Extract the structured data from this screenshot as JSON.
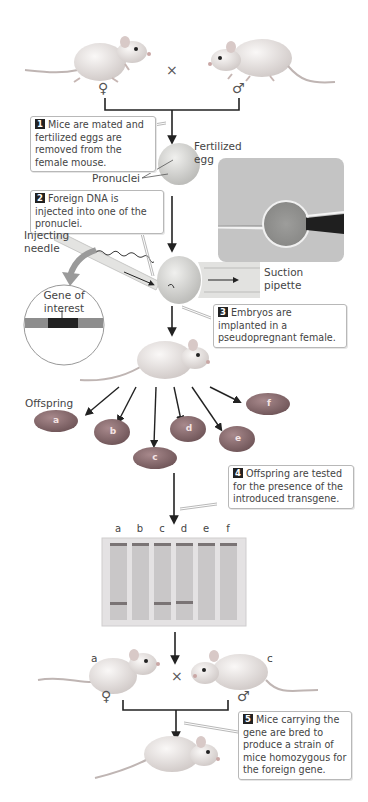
{
  "figure": {
    "steps": [
      {
        "number": "1",
        "text": "Mice are mated and fertilized eggs are removed from the female mouse."
      },
      {
        "number": "2",
        "text": "Foreign DNA is injected into one of the pronuclei."
      },
      {
        "number": "3",
        "text": "Embryos are implanted in a pseudopregnant female."
      },
      {
        "number": "4",
        "text": "Offspring are tested for the presence of the introduced transgene."
      },
      {
        "number": "5",
        "text": "Mice carrying the gene are bred to produce a strain of mice homozygous for the foreign gene."
      }
    ],
    "labels": {
      "fertilized_egg": "Fertilized egg",
      "pronuclei": "Pronuclei",
      "injecting_needle": "Injecting needle",
      "gene_of_interest": "Gene of interest",
      "suction_pipette": "Suction pipette",
      "offspring": "Offspring"
    },
    "symbols": {
      "cross": "×",
      "female": "♀",
      "male": "♂"
    },
    "parent_cross": {
      "female_label": "♀",
      "male_label": "♂"
    },
    "offspring": [
      "a",
      "b",
      "c",
      "d",
      "e",
      "f"
    ],
    "gel": {
      "lanes": [
        "a",
        "b",
        "c",
        "d",
        "e",
        "f"
      ],
      "transgene_band_present": [
        true,
        false,
        true,
        true,
        false,
        false
      ]
    },
    "second_cross": {
      "female_id": "a",
      "male_id": "c"
    },
    "colors": {
      "mouse_body": "#ece6e4",
      "pup": "#8a6a6e",
      "gel_bg": "#e4e2e3",
      "gel_lane": "#c9c7c8",
      "band": "#7a7475",
      "gene_bar": "#8d8d8d",
      "gene_block": "#222222",
      "egg": "#d6d6d4",
      "photo_bg": "#c2c2c2"
    }
  }
}
